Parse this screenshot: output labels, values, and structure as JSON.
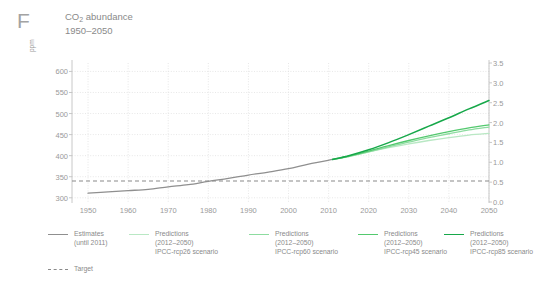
{
  "panel": {
    "letter": "F"
  },
  "header": {
    "title_prefix": "CO",
    "title_sub": "2",
    "title_suffix": " abundance",
    "subtitle": "1950–2050"
  },
  "chart_data": {
    "type": "line",
    "title": "CO2 abundance",
    "subtitle": "1950–2050",
    "xlabel": "",
    "ylabel": "ppm",
    "ylabel_right": "",
    "xlim": [
      1946,
      2050
    ],
    "ylim": [
      290,
      620
    ],
    "ylim_right": [
      0.0,
      3.5
    ],
    "grid": true,
    "legend_position": "bottom",
    "xticks": [
      1950,
      1960,
      1970,
      1980,
      1990,
      2000,
      2010,
      2020,
      2030,
      2040,
      2050
    ],
    "xtick_labels": [
      "1950",
      "1960",
      "1970",
      "1980",
      "1990",
      "2000",
      "2010",
      "2020",
      "2030",
      "2040",
      "2050"
    ],
    "yticks_left": [
      300,
      350,
      400,
      450,
      500,
      550,
      600
    ],
    "ytick_labels_left": [
      "300",
      "350",
      "400",
      "450",
      "500",
      "550",
      "600"
    ],
    "yticks_right": [
      0.0,
      0.5,
      1.0,
      1.5,
      2.0,
      2.5,
      3.0,
      3.5
    ],
    "ytick_labels_right": [
      "0.0",
      "0.5",
      "1.0",
      "1.5",
      "2.0",
      "2.5",
      "3.0",
      "3.5"
    ],
    "target_line": {
      "label": "Target",
      "value": 340,
      "style": "dashed",
      "color": "#8a8a8a"
    },
    "series": [
      {
        "name": "Estimates (until 2011)",
        "color": "#8f8f8f",
        "width": 1.3,
        "x": [
          1950,
          1955,
          1960,
          1965,
          1970,
          1975,
          1980,
          1985,
          1990,
          1995,
          2000,
          2005,
          2011
        ],
        "values": [
          311,
          314,
          317,
          320,
          326,
          331,
          339,
          346,
          354,
          361,
          369,
          380,
          391
        ]
      },
      {
        "name": "Predictions (2012–2050) IPCC-rcp26 scenario",
        "color": "#b9e8c4",
        "width": 1.3,
        "x": [
          2011,
          2015,
          2020,
          2025,
          2030,
          2035,
          2040,
          2045,
          2050
        ],
        "values": [
          391,
          398,
          409,
          419,
          428,
          436,
          443,
          449,
          453
        ]
      },
      {
        "name": "Predictions (2012–2050) IPCC-rcp60 scenario",
        "color": "#8ddca0",
        "width": 1.3,
        "x": [
          2011,
          2015,
          2020,
          2025,
          2030,
          2035,
          2040,
          2045,
          2050
        ],
        "values": [
          391,
          398,
          409,
          421,
          432,
          443,
          452,
          461,
          468
        ]
      },
      {
        "name": "Predictions (2012–2050) IPCC-rcp45 scenario",
        "color": "#53c96e",
        "width": 1.3,
        "x": [
          2011,
          2015,
          2020,
          2025,
          2030,
          2035,
          2040,
          2045,
          2050
        ],
        "values": [
          391,
          399,
          411,
          424,
          436,
          447,
          457,
          466,
          473
        ]
      },
      {
        "name": "Predictions (2012–2050) IPCC-rcp85 scenario",
        "color": "#17a84a",
        "width": 1.5,
        "x": [
          2011,
          2015,
          2020,
          2025,
          2030,
          2035,
          2040,
          2045,
          2050
        ],
        "values": [
          391,
          400,
          414,
          431,
          450,
          470,
          490,
          511,
          531
        ]
      }
    ]
  },
  "legend": {
    "entries": [
      {
        "line1": "Estimates",
        "line2": "(until 2011)",
        "line3": "",
        "color": "#8f8f8f"
      },
      {
        "line1": "Predictions",
        "line2": "(2012–2050)",
        "line3": "IPCC-rcp26 scenario",
        "color": "#b9e8c4"
      },
      {
        "line1": "Predictions",
        "line2": "(2012–2050)",
        "line3": "IPCC-rcp60 scenario",
        "color": "#8ddca0"
      },
      {
        "line1": "Predictions",
        "line2": "(2012–2050)",
        "line3": "IPCC-rcp45 scenario",
        "color": "#53c96e"
      },
      {
        "line1": "Predictions",
        "line2": "(2012–2050)",
        "line3": "IPCC-rcp85 scenario",
        "color": "#17a84a"
      }
    ],
    "target_label": "Target"
  }
}
